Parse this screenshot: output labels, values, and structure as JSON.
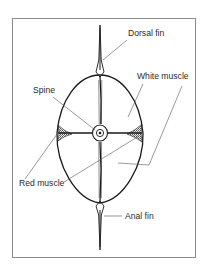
{
  "figure": {
    "type": "cross-section diagram",
    "labels": {
      "dorsal_fin": "Dorsal fin",
      "white_muscle": "White muscle",
      "spine": "Spine",
      "red_muscle": "Red muscle",
      "anal_fin": "Anal fin"
    }
  },
  "colors": {
    "frame": "#8a8a8a",
    "stroke": "#1a1a1a",
    "leader": "#555555",
    "text": "#2a2a2a"
  }
}
